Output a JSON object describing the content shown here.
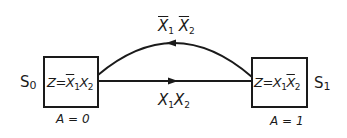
{
  "diagram": {
    "type": "state-diagram",
    "colors": {
      "stroke": "#1a1a1a",
      "background": "#ffffff"
    },
    "states": [
      {
        "id": "S0",
        "name": {
          "base": "S",
          "sub": "0"
        },
        "output": {
          "lhs": "Z",
          "eq": "=",
          "t1": {
            "var": "X",
            "sub": "1",
            "bar": true
          },
          "t2": {
            "var": "X",
            "sub": "2",
            "bar": false
          }
        },
        "assignment": "A = 0"
      },
      {
        "id": "S1",
        "name": {
          "base": "S",
          "sub": "1"
        },
        "output": {
          "lhs": "Z",
          "eq": "=",
          "t1": {
            "var": "X",
            "sub": "1",
            "bar": false
          },
          "t2": {
            "var": "X",
            "sub": "2",
            "bar": true
          }
        },
        "assignment": "A = 1"
      }
    ],
    "transitions": [
      {
        "from": "S1",
        "to": "S0",
        "shape": "arc",
        "condition": {
          "t1": {
            "var": "X",
            "sub": "1",
            "bar": true
          },
          "t2": {
            "var": "X",
            "sub": "2",
            "bar": true
          }
        }
      },
      {
        "from": "S0",
        "to": "S1",
        "shape": "straight",
        "condition": {
          "t1": {
            "var": "X",
            "sub": "1",
            "bar": false
          },
          "t2": {
            "var": "X",
            "sub": "2",
            "bar": false
          }
        }
      }
    ]
  }
}
